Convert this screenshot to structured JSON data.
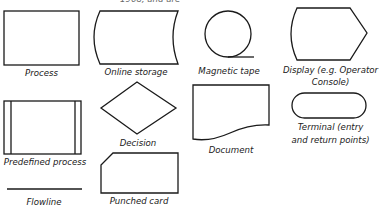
{
  "header": {
    "caption_fragment": "1968, and are"
  },
  "symbols": [
    {
      "id": "process",
      "label": "Process"
    },
    {
      "id": "online-storage",
      "label": "Online storage"
    },
    {
      "id": "magnetic-tape",
      "label": "Magnetic tape"
    },
    {
      "id": "display",
      "label_line1": "Display (e.g. Operator",
      "label_line2": "Console)"
    },
    {
      "id": "predefined-process",
      "label": "Predefined process"
    },
    {
      "id": "decision",
      "label": "Decision"
    },
    {
      "id": "document",
      "label": "Document"
    },
    {
      "id": "terminal",
      "label_line1": "Terminal (entry",
      "label_line2": "and return points)"
    },
    {
      "id": "flowline",
      "label": "Flowline"
    },
    {
      "id": "punched-card",
      "label": "Punched card"
    }
  ],
  "style": {
    "stroke_color": "#1a1a1a",
    "background": "#ffffff"
  }
}
